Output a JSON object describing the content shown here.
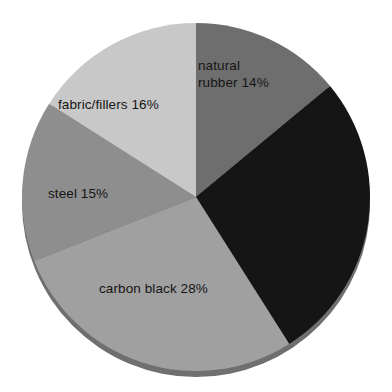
{
  "chart_data": {
    "type": "pie",
    "title": "",
    "subtitle": "",
    "xlabel": "",
    "ylabel": "",
    "grid": false,
    "legend_position": "none",
    "labels_inside_slices": true,
    "units": "percent",
    "total": 100,
    "categories": [
      "natural rubber",
      "synthetic rubber",
      "carbon black",
      "steel",
      "fabric/fillers"
    ],
    "values": [
      14,
      27,
      28,
      15,
      16
    ],
    "colors": [
      "#6e6e6e",
      "#151515",
      "#a0a0a0",
      "#8e8e8e",
      "#c8c8c8"
    ],
    "slices": [
      {
        "name": "natural rubber",
        "value": 14,
        "label": "natural",
        "label_line2": "rubber 14%",
        "color": "#6e6e6e",
        "start_angle_deg": 0,
        "end_angle_deg": 50.4
      },
      {
        "name": "synthetic rubber",
        "value": 27,
        "label": "synthetic rubber 27%",
        "color": "#151515",
        "start_angle_deg": 50.4,
        "end_angle_deg": 147.6
      },
      {
        "name": "carbon black",
        "value": 28,
        "label": "carbon black 28%",
        "color": "#a0a0a0",
        "start_angle_deg": 147.6,
        "end_angle_deg": 248.4
      },
      {
        "name": "steel",
        "value": 15,
        "label": "steel 15%",
        "color": "#8e8e8e",
        "start_angle_deg": 248.4,
        "end_angle_deg": 302.4
      },
      {
        "name": "fabric/fillers",
        "value": 16,
        "label": "fabric/fillers 16%",
        "color": "#c8c8c8",
        "start_angle_deg": 302.4,
        "end_angle_deg": 360
      }
    ]
  },
  "geometry": {
    "center_x": 196,
    "center_y": 197,
    "radius": 174,
    "shadow_color": "#6f6f6f"
  }
}
